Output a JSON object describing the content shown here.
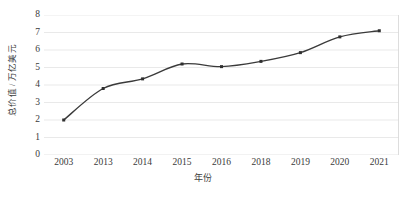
{
  "chart_data": {
    "type": "line",
    "title": "",
    "subtitle": "",
    "xlabel": "年份",
    "ylabel": "总价值 / 万亿美元",
    "categories": [
      "2003",
      "2013",
      "2014",
      "2015",
      "2016",
      "2018",
      "2019",
      "2020",
      "2021"
    ],
    "values": [
      2.0,
      3.8,
      4.35,
      5.2,
      5.05,
      5.35,
      5.85,
      6.75,
      7.1
    ],
    "series": [
      {
        "name": "总价值",
        "values": [
          2.0,
          3.8,
          4.35,
          5.2,
          5.05,
          5.35,
          5.85,
          6.75,
          7.1
        ]
      }
    ],
    "ylim": [
      0,
      8
    ],
    "yticks": [
      0,
      1,
      2,
      3,
      4,
      5,
      6,
      7,
      8
    ],
    "ytick_labels": [
      "0",
      "1",
      "2",
      "3",
      "4",
      "5",
      "6",
      "7",
      "8"
    ],
    "grid": true,
    "grid_axis": "y",
    "legend": false,
    "legend_position": "none",
    "smoothing": true,
    "markers": "square",
    "colors": {
      "line": "#3a3a3a",
      "marker": "#2f2f2f",
      "gridline": "#e6e6e6",
      "axis_line": "#d9d9d9",
      "text": "#3a3a3a",
      "background": "#ffffff"
    }
  }
}
